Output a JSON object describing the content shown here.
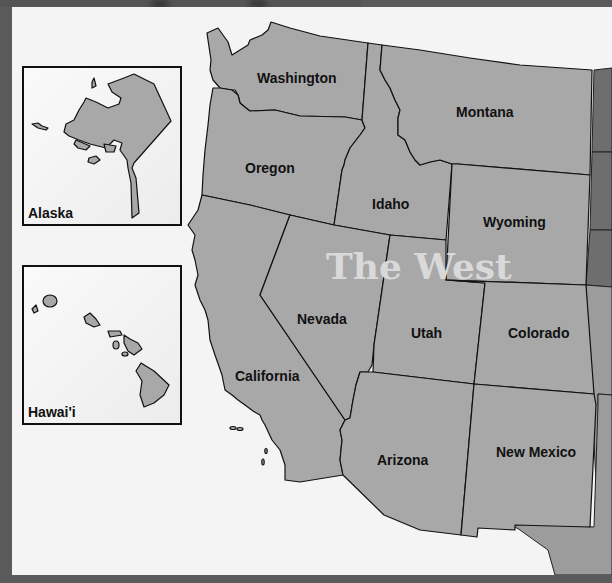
{
  "map": {
    "title": "The West",
    "states": [
      {
        "name": "Washington"
      },
      {
        "name": "Oregon"
      },
      {
        "name": "California"
      },
      {
        "name": "Idaho"
      },
      {
        "name": "Nevada"
      },
      {
        "name": "Montana"
      },
      {
        "name": "Wyoming"
      },
      {
        "name": "Utah"
      },
      {
        "name": "Colorado"
      },
      {
        "name": "Arizona"
      },
      {
        "name": "New Mexico"
      }
    ],
    "insets": [
      {
        "name": "Alaska"
      },
      {
        "name": "Hawai'i"
      }
    ],
    "colors": {
      "state_fill": "#a8a8a8",
      "neighbor_fill": "#6e6e6e",
      "background": "#f4f4f4",
      "frame": "#5a5a5a",
      "title_color": "#d9d9d9"
    }
  }
}
